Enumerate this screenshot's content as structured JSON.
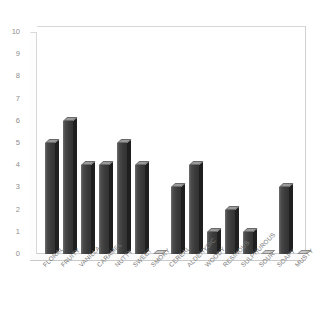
{
  "chart_data": {
    "type": "bar",
    "title": "",
    "subtitle": "",
    "xlabel": "",
    "ylabel": "",
    "ylim": [
      0,
      10
    ],
    "yticks": [
      0,
      1,
      2,
      3,
      4,
      5,
      6,
      7,
      8,
      9,
      10
    ],
    "ytick_labels": [
      "0",
      "1",
      "2",
      "3",
      "4",
      "5",
      "6",
      "7",
      "8",
      "9",
      "10"
    ],
    "grid": false,
    "legend": null,
    "legend_position": "none",
    "style": "3d-column",
    "categories": [
      "FLORAL",
      "FRUITY",
      "VANILLA",
      "CARAMEL",
      "NUTTY",
      "SWEET",
      "SMOKY",
      "CEREAL",
      "ALDEHYDIC",
      "WOODY",
      "RESINOUS",
      "SULPHUROUS",
      "SOUR",
      "SOAPY",
      "MUSTY"
    ],
    "values": [
      5,
      6,
      4,
      4,
      5,
      4,
      0,
      3,
      4,
      1,
      2,
      1,
      0,
      3,
      0
    ],
    "series": [
      {
        "name": "",
        "values": [
          5,
          6,
          4,
          4,
          5,
          4,
          0,
          3,
          4,
          1,
          2,
          1,
          0,
          3,
          0
        ],
        "color": "#3b3b3b"
      }
    ],
    "colors": {
      "bar_front": "#3b3b3b",
      "bar_side": "#1f1f1f",
      "bar_top": "#9a9a9a",
      "axis_text": "#8e8e8e",
      "wall": "#d8d8d8",
      "background": "#ffffff"
    }
  }
}
